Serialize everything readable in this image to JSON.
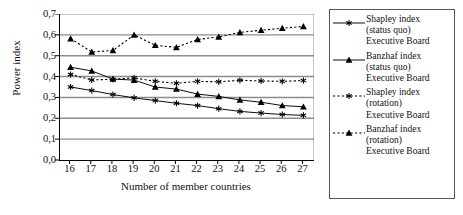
{
  "chart_data": {
    "type": "line",
    "title": "",
    "xlabel": "Number of member countries",
    "ylabel": "Power index",
    "x": [
      16,
      17,
      18,
      19,
      20,
      21,
      22,
      23,
      24,
      25,
      26,
      27
    ],
    "xtick_labels": [
      "16",
      "17",
      "18",
      "19",
      "20",
      "21",
      "22",
      "23",
      "24",
      "25",
      "26",
      "27"
    ],
    "ytick_labels": [
      "0,0",
      "0,1",
      "0,2",
      "0,3",
      "0,4",
      "0,5",
      "0,6",
      "0,7"
    ],
    "ytick_values": [
      0.0,
      0.1,
      0.2,
      0.3,
      0.4,
      0.5,
      0.6,
      0.7
    ],
    "ylim": [
      0.0,
      0.7
    ],
    "xlim": [
      15.5,
      27.5
    ],
    "grid": "horizontal",
    "legend_position": "right",
    "decimal_separator": ",",
    "series": [
      {
        "name": "Shapley index\n(status quo)\nExecutive Board",
        "line_style": "solid",
        "marker": "star",
        "color": "#000000",
        "values": [
          0.35,
          0.333,
          0.314,
          0.298,
          0.285,
          0.272,
          0.261,
          0.246,
          0.233,
          0.225,
          0.218,
          0.214
        ]
      },
      {
        "name": "Banzhaf index\n(status quo)\nExecutive Board",
        "line_style": "solid",
        "marker": "triangle",
        "color": "#000000",
        "values": [
          0.445,
          0.427,
          0.388,
          0.383,
          0.35,
          0.34,
          0.316,
          0.305,
          0.288,
          0.277,
          0.261,
          0.255
        ]
      },
      {
        "name": "Shapley index\n(rotation)\nExecutive Board",
        "line_style": "dotted",
        "marker": "star",
        "color": "#000000",
        "values": [
          0.41,
          0.384,
          0.387,
          0.394,
          0.377,
          0.368,
          0.377,
          0.375,
          0.382,
          0.379,
          0.377,
          0.381
        ]
      },
      {
        "name": " Banzhaf index\n(rotation)\nExecutive Board",
        "line_style": "dotted",
        "marker": "triangle",
        "color": "#000000",
        "values": [
          0.582,
          0.518,
          0.525,
          0.6,
          0.55,
          0.54,
          0.578,
          0.59,
          0.612,
          0.622,
          0.632,
          0.64
        ]
      }
    ]
  },
  "legend": {
    "items": [
      {
        "label": "Shapley index\n(status quo)\nExecutive Board"
      },
      {
        "label": "Banzhaf index\n(status quo)\nExecutive Board"
      },
      {
        "label": "Shapley index\n(rotation)\nExecutive Board"
      },
      {
        "label": " Banzhaf index\n(rotation)\nExecutive Board"
      }
    ]
  },
  "style": {
    "grid_color": "#8c8c8c",
    "axis_color": "#000000",
    "series_color": "#000000",
    "background": "#ffffff"
  }
}
